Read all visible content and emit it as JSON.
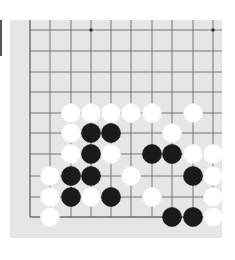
{
  "board": {
    "background": "#e6e6e6",
    "line_color": "#6b6b6b",
    "columns_x": [
      30,
      50,
      71,
      91,
      111,
      131,
      152,
      172,
      193,
      213
    ],
    "rows_y": [
      30,
      51,
      72,
      92,
      113,
      133,
      154,
      176,
      197,
      217
    ],
    "visible_edges": [
      "left",
      "bottom"
    ],
    "star_points": [
      [
        3,
        0
      ],
      [
        9,
        0
      ]
    ],
    "stone_radius": 9.5
  },
  "stones": [
    {
      "color": "white",
      "col": 2,
      "row": 4
    },
    {
      "color": "white",
      "col": 3,
      "row": 4
    },
    {
      "color": "white",
      "col": 4,
      "row": 4
    },
    {
      "color": "white",
      "col": 5,
      "row": 4
    },
    {
      "color": "white",
      "col": 6,
      "row": 4
    },
    {
      "color": "white",
      "col": 8,
      "row": 4
    },
    {
      "color": "white",
      "col": 2,
      "row": 5
    },
    {
      "color": "black",
      "col": 3,
      "row": 5
    },
    {
      "color": "black",
      "col": 4,
      "row": 5
    },
    {
      "color": "white",
      "col": 7,
      "row": 5
    },
    {
      "color": "white",
      "col": 2,
      "row": 6
    },
    {
      "color": "black",
      "col": 3,
      "row": 6
    },
    {
      "color": "white",
      "col": 4,
      "row": 6
    },
    {
      "color": "black",
      "col": 6,
      "row": 6
    },
    {
      "color": "black",
      "col": 7,
      "row": 6
    },
    {
      "color": "white",
      "col": 8,
      "row": 6
    },
    {
      "color": "white",
      "col": 9,
      "row": 6
    },
    {
      "color": "white",
      "col": 1,
      "row": 7
    },
    {
      "color": "black",
      "col": 2,
      "row": 7
    },
    {
      "color": "black",
      "col": 3,
      "row": 7
    },
    {
      "color": "white",
      "col": 5,
      "row": 7
    },
    {
      "color": "black",
      "col": 8,
      "row": 7
    },
    {
      "color": "white",
      "col": 9,
      "row": 7
    },
    {
      "color": "white",
      "col": 1,
      "row": 8
    },
    {
      "color": "black",
      "col": 2,
      "row": 8
    },
    {
      "color": "white",
      "col": 3,
      "row": 8
    },
    {
      "color": "black",
      "col": 4,
      "row": 8
    },
    {
      "color": "white",
      "col": 6,
      "row": 8
    },
    {
      "color": "white",
      "col": 9,
      "row": 8
    },
    {
      "color": "white",
      "col": 1,
      "row": 9
    },
    {
      "color": "black",
      "col": 7,
      "row": 9
    },
    {
      "color": "black",
      "col": 8,
      "row": 9
    },
    {
      "color": "white",
      "col": 9,
      "row": 9
    }
  ],
  "colors": {
    "black_stone": "#1a1a1a",
    "white_stone": "#ffffff"
  }
}
